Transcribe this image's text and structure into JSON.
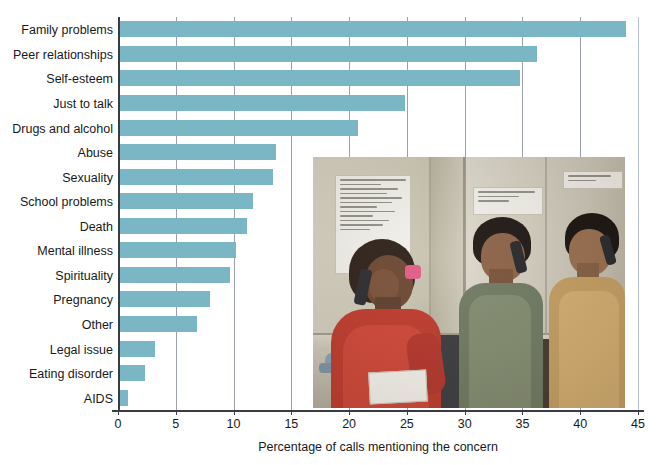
{
  "chart_data": {
    "type": "bar",
    "orientation": "horizontal",
    "title": "",
    "xlabel": "Percentage of calls mentioning the concern",
    "ylabel": "",
    "xlim": [
      0,
      45
    ],
    "xticks": [
      0,
      5,
      10,
      15,
      20,
      25,
      30,
      35,
      40,
      45
    ],
    "grid": true,
    "legend": false,
    "bar_color": "#7ab6c3",
    "categories": [
      "Family problems",
      "Peer relationships",
      "Self-esteem",
      "Just to talk",
      "Drugs and alcohol",
      "Abuse",
      "Sexuality",
      "School problems",
      "Death",
      "Mental illness",
      "Spirituality",
      "Pregnancy",
      "Other",
      "Legal issue",
      "Eating disorder",
      "AIDS"
    ],
    "values": [
      44.0,
      36.3,
      34.8,
      24.8,
      20.8,
      13.7,
      13.4,
      11.7,
      11.2,
      10.2,
      9.7,
      8.0,
      6.8,
      3.2,
      2.3,
      0.9
    ]
  },
  "axis": {
    "x_tick_labels": [
      "0",
      "5",
      "10",
      "15",
      "20",
      "25",
      "30",
      "35",
      "40",
      "45"
    ],
    "x_title": "Percentage of calls mentioning the concern"
  },
  "photo": {
    "alt_description": "Three teenage volunteers seated at a counter answering telephones at a peer hotline",
    "notes": [
      {
        "id": "note-big",
        "text": "Thank you, have me some, but then you! And drop back simple, here good lucky!"
      },
      {
        "id": "note-mid",
        "text": "LISTEN WITH CARE! SAVE A LIFE!"
      },
      {
        "id": "note-right",
        "text": "JUDGE NOT LIFE!"
      }
    ]
  }
}
